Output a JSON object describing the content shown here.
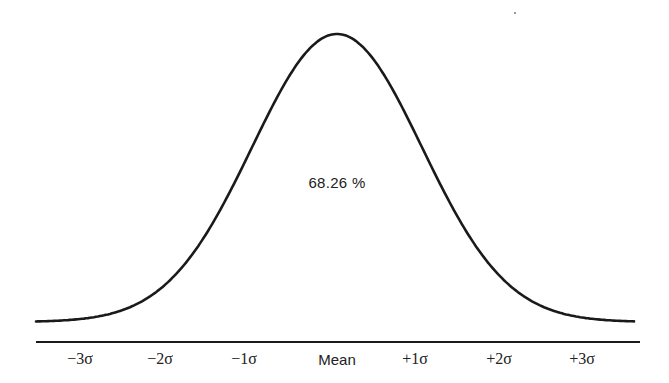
{
  "diagram": {
    "title": "",
    "type": "normal-distribution-curve",
    "center_annotation": "68.26 %",
    "axis_labels": [
      {
        "label": "−3σ",
        "x": 80
      },
      {
        "label": "−2σ",
        "x": 160
      },
      {
        "label": "−1σ",
        "x": 244
      },
      {
        "label": "Mean",
        "x": 337
      },
      {
        "label": "+1σ",
        "x": 415
      },
      {
        "label": "+2σ",
        "x": 499
      },
      {
        "label": "+3σ",
        "x": 582
      }
    ],
    "curve": {
      "mean_x": 337,
      "sigma_px": 85,
      "peak_y": 34,
      "baseline_y": 322,
      "x_start": 36,
      "x_end": 634,
      "stroke_color": "#1a1a1a"
    },
    "axis": {
      "x_start": 36,
      "x_end": 640,
      "y": 342,
      "color": "#1a1a1a"
    }
  }
}
